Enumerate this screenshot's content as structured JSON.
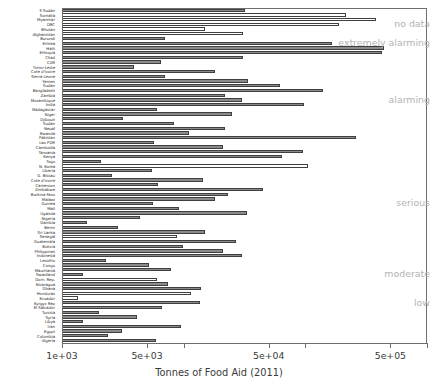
{
  "chart_data": {
    "type": "bar",
    "orientation": "horizontal",
    "title": "",
    "xlabel": "Tonnes of Food Aid (2011)",
    "ylabel": "",
    "xscale": "log",
    "xlim": [
      1000,
      1000000
    ],
    "grid": false,
    "legend": "none",
    "xtick_values": [
      1000,
      5000,
      10000,
      50000,
      100000,
      500000,
      1000000
    ],
    "xtick_labels": [
      "1e+03",
      "5e+03",
      "",
      "5e+04",
      "",
      "5e+05",
      ""
    ],
    "annotations": [
      {
        "label": "no data",
        "y_index": 3
      },
      {
        "label": "extremely alarming",
        "y_index": 7
      },
      {
        "label": "alarming",
        "y_index": 19
      },
      {
        "label": "serious",
        "y_index": 41
      },
      {
        "label": "moderate",
        "y_index": 56
      },
      {
        "label": "low",
        "y_index": 62
      }
    ],
    "categories": [
      "S Sudan",
      "Somalia",
      "Myanmar",
      "DRC",
      "Bhutan",
      "Afghanistan",
      "Burundi",
      "Eritrea",
      "Haiti",
      "Ethiopia",
      "Chad",
      "CAR",
      "Timor-Leste",
      "Cote d'Ivoire",
      "Sierra Leone",
      "Yemen",
      "Sudan",
      "Bangladesh",
      "Zambia",
      "Mozambique",
      "India",
      "Madagascar",
      "Niger",
      "Djibouti",
      "Sudan",
      "Nepal",
      "Rwanda",
      "Pakistan",
      "Lao PDR",
      "Cambodia",
      "Tanzania",
      "Kenya",
      "Togo",
      "N. Korea",
      "Liberia",
      "G. Bissau",
      "Cote d'Ivoire",
      "Cameroon",
      "Zimbabwe",
      "Burkina Faso",
      "Malawi",
      "Guinea",
      "Mali",
      "Uganda",
      "Nigeria",
      "Gambia",
      "Benin",
      "Sri Lanka",
      "Senegal",
      "Guatemala",
      "Bolivia",
      "Philippines",
      "Indonesia",
      "Lesotho",
      "Congo",
      "Mauritania",
      "Swaziland",
      "Dom. Rep.",
      "Nicaragua",
      "Ghana",
      "Honduras",
      "Ecuador",
      "Kyrgyz Rep",
      "El Salvador",
      "Tunisia",
      "Syria",
      "Libya",
      "Iran",
      "Egypt",
      "Colombia",
      "Algeria"
    ],
    "values": [
      32000,
      215000,
      380000,
      190000,
      15000,
      31000,
      7000,
      165000,
      445000,
      430000,
      31000,
      6500,
      3900,
      18000,
      7000,
      34000,
      62000,
      140000,
      22000,
      30000,
      98000,
      6000,
      25000,
      3200,
      8300,
      22000,
      11000,
      260000,
      5700,
      21000,
      96000,
      64000,
      2100,
      105000,
      5500,
      2600,
      14500,
      6200,
      45000,
      23000,
      18000,
      5600,
      9200,
      33000,
      4400,
      1600,
      2900,
      15000,
      8800,
      27000,
      9800,
      21000,
      30000,
      2300,
      5200,
      7800,
      1500,
      6000,
      7400,
      14000,
      11500,
      1350,
      13500,
      6600,
      2000,
      4100,
      1500,
      9500,
      3100,
      2400,
      5900
    ],
    "bar_styles": [
      "filled",
      "empty",
      "empty",
      "empty",
      "empty",
      "empty",
      "filled",
      "filled",
      "filled",
      "filled",
      "filled",
      "filled",
      "filled",
      "filled",
      "filled",
      "filled",
      "filled",
      "filled",
      "filled",
      "filled",
      "filled",
      "filled",
      "filled",
      "filled",
      "filled",
      "filled",
      "filled",
      "filled",
      "filled",
      "filled",
      "filled",
      "filled",
      "filled",
      "empty",
      "filled",
      "filled",
      "filled",
      "filled",
      "filled",
      "filled",
      "filled",
      "filled",
      "filled",
      "filled",
      "filled",
      "filled",
      "filled",
      "filled",
      "empty",
      "filled",
      "filled",
      "filled",
      "filled",
      "filled",
      "filled",
      "filled",
      "filled",
      "empty",
      "filled",
      "filled",
      "empty",
      "empty",
      "filled",
      "filled",
      "filled",
      "filled",
      "filled",
      "filled",
      "filled",
      "filled",
      "filled"
    ]
  }
}
